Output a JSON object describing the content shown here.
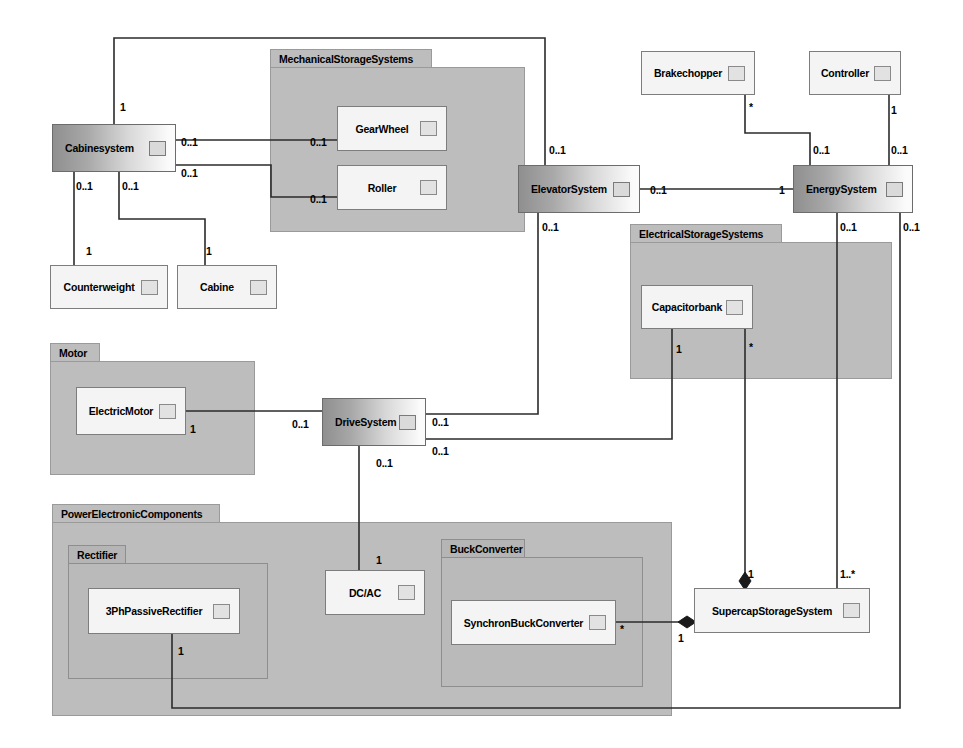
{
  "diagram": {
    "type": "uml-package-class-diagram",
    "canvas": {
      "width": 963,
      "height": 748
    }
  },
  "packages": [
    {
      "id": "mechanical",
      "label": "MechanicalStorageSystems",
      "x": 270,
      "y": 49,
      "w": 255,
      "h": 183,
      "tab_w": 162,
      "nested": false
    },
    {
      "id": "electrical",
      "label": "ElectricalStorageSystems",
      "x": 630,
      "y": 224,
      "w": 262,
      "h": 155,
      "tab_w": 152,
      "nested": false
    },
    {
      "id": "motor",
      "label": "Motor",
      "x": 50,
      "y": 343,
      "w": 205,
      "h": 132,
      "tab_w": 50,
      "nested": false
    },
    {
      "id": "powerelectronic",
      "label": "PowerElectronicComponents",
      "x": 52,
      "y": 504,
      "w": 620,
      "h": 212,
      "tab_w": 168,
      "nested": false
    },
    {
      "id": "rectifier",
      "label": "Rectifier",
      "x": 68,
      "y": 545,
      "w": 200,
      "h": 134,
      "tab_w": 58,
      "nested": true
    },
    {
      "id": "buckconverter",
      "label": "BuckConverter",
      "x": 441,
      "y": 539,
      "w": 202,
      "h": 148,
      "tab_w": 84,
      "nested": true
    }
  ],
  "classes": [
    {
      "id": "cabinesystem",
      "label": "Cabinesystem",
      "x": 52,
      "y": 124,
      "w": 124,
      "h": 48,
      "style": "gradient"
    },
    {
      "id": "gearwheel",
      "label": "GearWheel",
      "x": 337,
      "y": 106,
      "w": 110,
      "h": 45,
      "style": "plain"
    },
    {
      "id": "roller",
      "label": "Roller",
      "x": 337,
      "y": 165,
      "w": 110,
      "h": 45,
      "style": "plain"
    },
    {
      "id": "counterweight",
      "label": "Counterweight",
      "x": 50,
      "y": 265,
      "w": 118,
      "h": 44,
      "style": "plain"
    },
    {
      "id": "cabine",
      "label": "Cabine",
      "x": 177,
      "y": 265,
      "w": 100,
      "h": 44,
      "style": "plain"
    },
    {
      "id": "brakechopper",
      "label": "Brakechopper",
      "x": 641,
      "y": 51,
      "w": 114,
      "h": 44,
      "style": "plain"
    },
    {
      "id": "controller",
      "label": "Controller",
      "x": 809,
      "y": 51,
      "w": 92,
      "h": 44,
      "style": "plain"
    },
    {
      "id": "elevatorsystem",
      "label": "ElevatorSystem",
      "x": 518,
      "y": 165,
      "w": 122,
      "h": 48,
      "style": "gradient"
    },
    {
      "id": "energysystem",
      "label": "EnergySystem",
      "x": 793,
      "y": 165,
      "w": 120,
      "h": 48,
      "style": "gradient"
    },
    {
      "id": "capacitorbank",
      "label": "Capacitorbank",
      "x": 641,
      "y": 285,
      "w": 112,
      "h": 44,
      "style": "plain"
    },
    {
      "id": "electricmotor",
      "label": "ElectricMotor",
      "x": 76,
      "y": 387,
      "w": 110,
      "h": 48,
      "style": "plain"
    },
    {
      "id": "drivesystem",
      "label": "DriveSystem",
      "x": 322,
      "y": 398,
      "w": 104,
      "h": 48,
      "style": "gradient"
    },
    {
      "id": "dcac",
      "label": "DC/AC",
      "x": 325,
      "y": 570,
      "w": 100,
      "h": 45,
      "style": "plain"
    },
    {
      "id": "3phpassiverectifier",
      "label": "3PhPassiveRectifier",
      "x": 88,
      "y": 588,
      "w": 152,
      "h": 46,
      "style": "plain"
    },
    {
      "id": "synchronbuckconverter",
      "label": "SynchronBuckConverter",
      "x": 451,
      "y": 600,
      "w": 165,
      "h": 45,
      "style": "plain"
    },
    {
      "id": "supercapstoragesystem",
      "label": "SupercapStorageSystem",
      "x": 694,
      "y": 588,
      "w": 176,
      "h": 45,
      "style": "plain"
    }
  ],
  "multiplicities": [
    {
      "id": "m-cabinesys-top",
      "text": "1",
      "x": 120,
      "y": 101
    },
    {
      "id": "m-cabinesys-gearwheel",
      "text": "0..1",
      "x": 181,
      "y": 136
    },
    {
      "id": "m-gearwheel-end",
      "text": "0..1",
      "x": 310,
      "y": 136
    },
    {
      "id": "m-cabinesys-roller",
      "text": "0..1",
      "x": 181,
      "y": 167
    },
    {
      "id": "m-roller-end",
      "text": "0..1",
      "x": 310,
      "y": 193
    },
    {
      "id": "m-cabinesys-cw",
      "text": "0..1",
      "x": 76,
      "y": 180
    },
    {
      "id": "m-cabinesys-cab",
      "text": "0..1",
      "x": 122,
      "y": 180
    },
    {
      "id": "m-counterweight-end",
      "text": "1",
      "x": 86,
      "y": 245
    },
    {
      "id": "m-cabine-end",
      "text": "1",
      "x": 206,
      "y": 245
    },
    {
      "id": "m-brakechopper-end",
      "text": "*",
      "x": 749,
      "y": 101
    },
    {
      "id": "m-controller-end",
      "text": "1",
      "x": 891,
      "y": 104
    },
    {
      "id": "m-energysys-brake",
      "text": "0..1",
      "x": 813,
      "y": 144
    },
    {
      "id": "m-energysys-ctrl",
      "text": "0..1",
      "x": 891,
      "y": 144
    },
    {
      "id": "m-elevator-top",
      "text": "0..1",
      "x": 549,
      "y": 144
    },
    {
      "id": "m-elevator-energy",
      "text": "0..1",
      "x": 650,
      "y": 184
    },
    {
      "id": "m-energy-elevator",
      "text": "1",
      "x": 779,
      "y": 184
    },
    {
      "id": "m-elevator-bottom",
      "text": "0..1",
      "x": 542,
      "y": 221
    },
    {
      "id": "m-energysys-down1",
      "text": "0..1",
      "x": 840,
      "y": 221
    },
    {
      "id": "m-energysys-down2",
      "text": "0..1",
      "x": 903,
      "y": 221
    },
    {
      "id": "m-capacitorbank-1",
      "text": "1",
      "x": 676,
      "y": 343
    },
    {
      "id": "m-capacitorbank-star",
      "text": "*",
      "x": 749,
      "y": 341
    },
    {
      "id": "m-electricmotor-end",
      "text": "1",
      "x": 190,
      "y": 423
    },
    {
      "id": "m-drivesystem-motor",
      "text": "0..1",
      "x": 292,
      "y": 418
    },
    {
      "id": "m-drivesystem-right1",
      "text": "0..1",
      "x": 432,
      "y": 416
    },
    {
      "id": "m-drivesystem-right2",
      "text": "0..1",
      "x": 432,
      "y": 445
    },
    {
      "id": "m-drivesystem-down",
      "text": "0..1",
      "x": 376,
      "y": 457
    },
    {
      "id": "m-dcac-top",
      "text": "1",
      "x": 376,
      "y": 554
    },
    {
      "id": "m-rectifier-1",
      "text": "1",
      "x": 178,
      "y": 645
    },
    {
      "id": "m-supercap-top1",
      "text": "1",
      "x": 748,
      "y": 568
    },
    {
      "id": "m-supercap-top2",
      "text": "1..*",
      "x": 840,
      "y": 568
    },
    {
      "id": "m-synchron-star",
      "text": "*",
      "x": 620,
      "y": 623
    },
    {
      "id": "m-supercap-left-1",
      "text": "1",
      "x": 678,
      "y": 632
    }
  ],
  "colors": {
    "package_fill": "#bdbdbd",
    "package_nested_fill": "#bababa",
    "class_fill": "#f4f4f4",
    "gradient_dark": "#8f8f8f",
    "gradient_light": "#fbfbfb",
    "line": "#2b2b2b",
    "border": "#7d7d7d"
  }
}
